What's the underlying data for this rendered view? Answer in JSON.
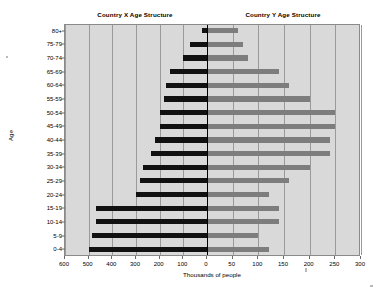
{
  "chart_data": {
    "type": "bar",
    "subtype": "population-pyramid",
    "title": "",
    "panel_titles": {
      "left": "Country X Age Structure",
      "right": "Country Y Age Structure"
    },
    "xlabel": "Thousands of people",
    "ylabel": "Age",
    "grid": true,
    "legend_position": "none",
    "orientation": "horizontal",
    "categories": [
      "80+",
      "75-79",
      "70-74",
      "65-69",
      "60-64",
      "55-59",
      "50-54",
      "45-49",
      "40-44",
      "35-39",
      "30-34",
      "25-29",
      "20-24",
      "15-19",
      "10-14",
      "5-9",
      "0-4"
    ],
    "series": [
      {
        "name": "Country X Age Structure",
        "side": "left",
        "color": "#111111",
        "axis_max": 600,
        "values": [
          20,
          70,
          100,
          155,
          175,
          180,
          200,
          200,
          220,
          235,
          270,
          285,
          300,
          470,
          470,
          485,
          500
        ]
      },
      {
        "name": "Country Y Age Structure",
        "side": "right",
        "color": "#7d7d7d",
        "axis_max": 300,
        "values": [
          60,
          70,
          80,
          140,
          160,
          200,
          250,
          250,
          240,
          240,
          200,
          160,
          120,
          140,
          140,
          100,
          120
        ]
      }
    ],
    "left_axis": {
      "ticks": [
        600,
        500,
        400,
        300,
        200,
        100,
        0
      ],
      "tick_labels": [
        "600",
        "500",
        "400",
        "300",
        "200",
        "100",
        "0"
      ],
      "range": [
        600,
        0
      ]
    },
    "right_axis": {
      "ticks": [
        0,
        50,
        100,
        150,
        200,
        250,
        300
      ],
      "tick_labels": [
        "0",
        "50",
        "100",
        "150",
        "200",
        "250",
        "300"
      ],
      "range": [
        0,
        300
      ]
    },
    "colors": {
      "plot_background": "#d9d9d9",
      "gridline": "#9a9a9a",
      "zero_line": "#000000",
      "left_bar": "#111111",
      "right_bar": "#7d7d7d",
      "text": "#000000"
    }
  }
}
